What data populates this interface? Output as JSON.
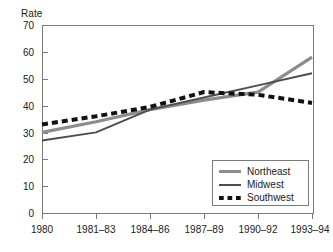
{
  "chart_data": {
    "type": "line",
    "title": "",
    "ylabel": "Rate",
    "xlabel": "",
    "grid": false,
    "legend_position": "bottom-right",
    "ylim": [
      0,
      70
    ],
    "yticks": [
      0,
      10,
      20,
      30,
      40,
      50,
      60,
      70
    ],
    "categories": [
      "1980",
      "1981–83",
      "1984–86",
      "1987–89",
      "1990–92",
      "1993–94"
    ],
    "series": [
      {
        "name": "Northeast",
        "color": "#8c8c8c",
        "style": "solid-thick",
        "values": [
          30,
          34,
          38.5,
          42,
          45,
          58
        ]
      },
      {
        "name": "Midwest",
        "color": "#4d4d4d",
        "style": "solid-thin",
        "values": [
          27,
          30,
          38.5,
          43,
          47.5,
          52
        ]
      },
      {
        "name": "Southwest",
        "color": "#111111",
        "style": "dotted-thick",
        "values": [
          33,
          36,
          39.5,
          45,
          44,
          41
        ]
      }
    ]
  },
  "axis": {
    "y_title": "Rate",
    "y_tick_labels": [
      "70",
      "60",
      "50",
      "40",
      "30",
      "20",
      "10",
      "0"
    ],
    "x_tick_labels": [
      "1980",
      "1981–83",
      "1984–86",
      "1987–89",
      "1990–92",
      "1993–94"
    ]
  },
  "legend": {
    "items": [
      {
        "label": "Northeast",
        "swatch": "thick-gray-line-icon"
      },
      {
        "label": "Midwest",
        "swatch": "thin-dark-line-icon"
      },
      {
        "label": "Southwest",
        "swatch": "dotted-black-line-icon"
      }
    ]
  },
  "colors": {
    "northeast": "#8c8c8c",
    "midwest": "#4d4d4d",
    "southwest": "#111111",
    "axis": "#7a7a7a",
    "text": "#1a1a1a"
  }
}
